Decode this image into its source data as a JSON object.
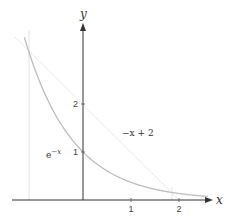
{
  "diagram": {
    "axis_labels": {
      "x": "x",
      "y": "y"
    },
    "x_ticks": [
      {
        "value": 1,
        "label": "1"
      },
      {
        "value": 2,
        "label": "2"
      }
    ],
    "y_ticks": [
      {
        "value": 1,
        "label": "1"
      },
      {
        "value": 2,
        "label": "2"
      }
    ],
    "curves": [
      {
        "name": "exponential",
        "label": "e",
        "label_sup": "−x",
        "color": "#b8b8b8"
      },
      {
        "name": "tangent-line",
        "label": "−x + 2",
        "color": "#d8d8d8"
      }
    ],
    "colors": {
      "axis": "#333333",
      "curve": "#b8b8b8",
      "line": "#dcdcdc",
      "guide": "#e2e2e2"
    }
  }
}
